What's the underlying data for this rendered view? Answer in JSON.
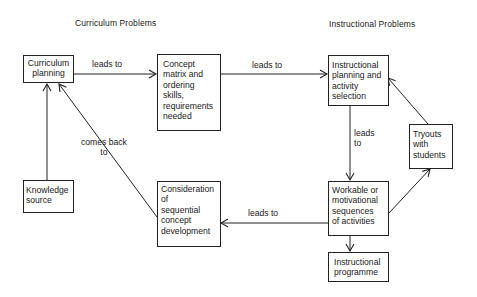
{
  "headings": {
    "left": "Curriculum Problems",
    "right": "Instructional Problems"
  },
  "nodes": {
    "curriculum_planning": "Curriculum\nplanning",
    "concept_matrix": "Concept\nmatrix and\nordering\nskills,\nrequirements\nneeded",
    "instructional_planning": "Instructional\nplanning and\nactivity\nselection",
    "tryouts": "Tryouts\nwith\nstudents",
    "knowledge_source": "Knowledge\nsource",
    "consideration": "Consideration\nof\nsequential\nconcept\ndevelopment",
    "workable": "Workable or\nmotivational\nsequences\nof activities",
    "instructional_programme": "Instructional\nprogramme"
  },
  "edge_labels": {
    "cp_to_cm": "leads to",
    "cm_to_ip": "leads to",
    "ip_to_wk": "leads\nto",
    "wk_to_cs": "leads to",
    "cs_to_cp": "comes back\nto"
  },
  "edges": [
    {
      "from": "curriculum_planning",
      "to": "concept_matrix",
      "label": "leads to"
    },
    {
      "from": "concept_matrix",
      "to": "instructional_planning",
      "label": "leads to"
    },
    {
      "from": "instructional_planning",
      "to": "workable",
      "label": "leads to"
    },
    {
      "from": "workable",
      "to": "tryouts",
      "label": ""
    },
    {
      "from": "tryouts",
      "to": "instructional_planning",
      "label": ""
    },
    {
      "from": "workable",
      "to": "consideration",
      "label": "leads to"
    },
    {
      "from": "consideration",
      "to": "curriculum_planning",
      "label": "comes back to"
    },
    {
      "from": "knowledge_source",
      "to": "curriculum_planning",
      "label": ""
    },
    {
      "from": "workable",
      "to": "instructional_programme",
      "label": ""
    }
  ],
  "colors": {
    "line": "#222222",
    "background": "#ffffff"
  }
}
